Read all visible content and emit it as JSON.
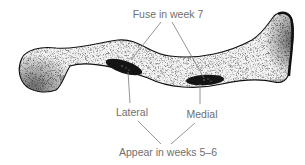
{
  "figure": {
    "labels": {
      "fuse": "Fuse in week 7",
      "lateral": "Lateral",
      "medial": "Medial",
      "appear": "Appear in weeks 5–6"
    },
    "colors": {
      "bone_fill": "#f2f2f2",
      "bone_outline": "#111111",
      "ossification_center": "#141414",
      "label_text": "#6f6f6f",
      "leader_line": "#7a7a7a"
    }
  }
}
